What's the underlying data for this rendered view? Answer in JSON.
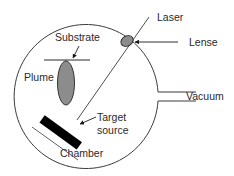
{
  "diagram": {
    "labels": {
      "laser": "Laser",
      "lense": "Lense",
      "substrate": "Substrate",
      "plume": "Plume",
      "target_line1": "Target",
      "target_line2": "source",
      "vacuum": "Vacuum",
      "chamber": "Chamber"
    },
    "colors": {
      "line": "#3a3a3a",
      "plume_fill": "#8c8c8c",
      "lens_fill": "#8c8c8c",
      "target_fill": "#000000",
      "background": "#ffffff"
    }
  }
}
